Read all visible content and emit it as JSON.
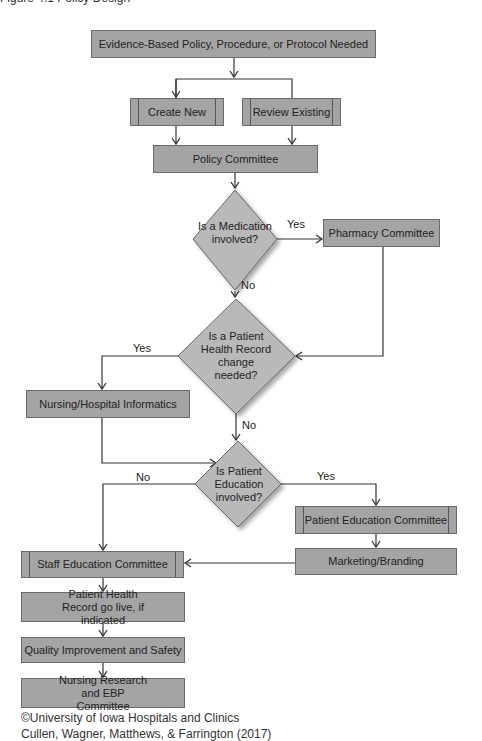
{
  "header": {
    "cut_off_text": "Figure 4.1 Policy Design"
  },
  "nodes": {
    "start": "Evidence-Based Policy, Procedure, or Protocol Needed",
    "create_new": "Create New",
    "review_existing": "Review Existing",
    "policy_committee": "Policy Committee",
    "decision_medication": "Is a Medication involved?",
    "pharmacy_committee": "Pharmacy Committee",
    "decision_phr": "Is a Patient Health Record change needed?",
    "informatics": "Nursing/Hospital Informatics",
    "decision_patient_ed": "Is Patient Education involved?",
    "patient_ed_committee": "Patient Education Committee",
    "marketing": "Marketing/Branding",
    "staff_ed_committee": "Staff Education Committee",
    "phr_go_live": "Patient Health Record go live, if indicated",
    "quality": "Quality Improvement and Safety",
    "research": "Nursing Research and EBP Committee"
  },
  "labels": {
    "yes1": "Yes",
    "no1": "No",
    "yes2": "Yes",
    "no2": "No",
    "yes3": "Yes",
    "no3": "No"
  },
  "credit": {
    "line1": "©University of Iowa Hospitals and Clinics",
    "line2": "Cullen, Wagner, Matthews, & Farrington (2017)"
  },
  "colors": {
    "box_fill": "#a4a4a4",
    "diamond_fill": "#b9b9b9",
    "line": "#333333"
  }
}
